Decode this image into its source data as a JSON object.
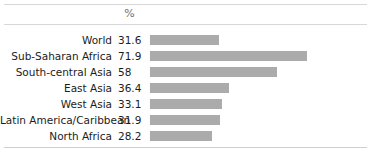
{
  "chart_data": {
    "type": "bar",
    "orientation": "horizontal",
    "title": "",
    "subtitle": "",
    "xlabel": "%",
    "ylabel": "",
    "column_header": "%",
    "categories": [
      "World",
      "Sub-Saharan Africa",
      "South-central Asia",
      "East Asia",
      "West Asia",
      "Latin America/Caribbean",
      "North Africa"
    ],
    "values": [
      31.6,
      71.9,
      58,
      36.4,
      33.1,
      31.9,
      28.2
    ],
    "value_labels": [
      "31.6",
      "71.9",
      "58",
      "36.4",
      "33.1",
      "31.9",
      "28.2"
    ],
    "xlim": [
      0,
      71.9
    ],
    "grid": false,
    "legend": null,
    "bar_color": "#ababab",
    "text_color": "#1c1c1c",
    "header_color": "#6f6f6f",
    "rule_color": "#d8d8d8",
    "background": "#ffffff"
  },
  "rows": [
    {
      "label": "World",
      "value": "31.6",
      "num": 31.6
    },
    {
      "label": "Sub-Saharan Africa",
      "value": "71.9",
      "num": 71.9
    },
    {
      "label": "South-central Asia",
      "value": "58",
      "num": 58
    },
    {
      "label": "East Asia",
      "value": "36.4",
      "num": 36.4
    },
    {
      "label": "West Asia",
      "value": "33.1",
      "num": 33.1
    },
    {
      "label": "Latin America/Caribbean",
      "value": "31.9",
      "num": 31.9
    },
    {
      "label": "North Africa",
      "value": "28.2",
      "num": 28.2
    }
  ],
  "header": {
    "percent_label": "%"
  }
}
